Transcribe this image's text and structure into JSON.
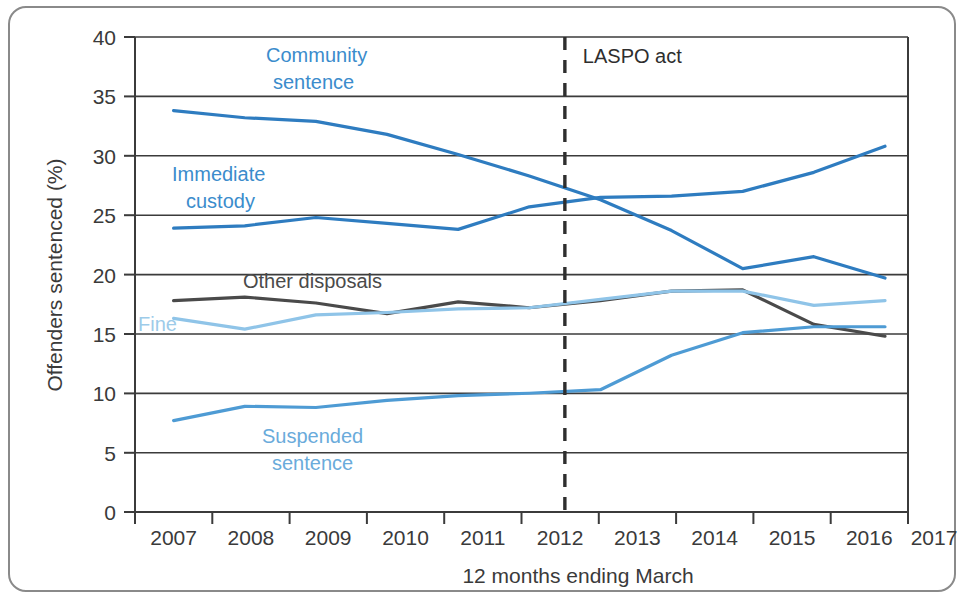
{
  "figure": {
    "border_color": "#8a8a8a",
    "background": "#ffffff"
  },
  "chart_data": {
    "type": "line",
    "title": "",
    "xlabel": "12 months ending March",
    "ylabel": "Offenders sentenced (%)",
    "categories": [
      "2007",
      "2008",
      "2009",
      "2010",
      "2011",
      "2012",
      "2013",
      "2014",
      "2015",
      "2016",
      "2017"
    ],
    "x": [
      2007,
      2008,
      2009,
      2010,
      2011,
      2012,
      2013,
      2014,
      2015,
      2016,
      2017
    ],
    "ylim": [
      0,
      40
    ],
    "yticks": [
      0,
      5,
      10,
      15,
      20,
      25,
      30,
      35,
      40
    ],
    "grid": "horizontal",
    "legend": "inline-annotations",
    "series": [
      {
        "name": "Community sentence",
        "color": "#2e7cc0",
        "values": [
          33.8,
          33.2,
          32.9,
          31.8,
          30.1,
          28.3,
          26.3,
          23.7,
          20.5,
          21.5,
          19.7
        ]
      },
      {
        "name": "Immediate custody",
        "color": "#2e7cc0",
        "values": [
          23.9,
          24.1,
          24.8,
          24.3,
          23.8,
          25.7,
          26.5,
          26.6,
          27.0,
          28.6,
          30.8
        ]
      },
      {
        "name": "Other disposals",
        "color": "#4a4a4a",
        "values": [
          17.8,
          18.1,
          17.6,
          16.7,
          17.7,
          17.2,
          17.8,
          18.6,
          18.7,
          15.8,
          14.8
        ]
      },
      {
        "name": "Fine",
        "color": "#8fc4e8",
        "values": [
          16.3,
          15.4,
          16.6,
          16.8,
          17.1,
          17.2,
          17.9,
          18.6,
          18.6,
          17.4,
          17.8
        ]
      },
      {
        "name": "Suspended sentence",
        "color": "#4e9bd4",
        "values": [
          7.7,
          8.9,
          8.8,
          9.4,
          9.8,
          10.0,
          10.3,
          13.2,
          15.1,
          15.6,
          15.6
        ]
      }
    ],
    "annotations": [
      {
        "text": "Community sentence",
        "color": "#3b8ccc",
        "kind": "series-label"
      },
      {
        "text": "Immediate custody",
        "color": "#3b8ccc",
        "kind": "series-label"
      },
      {
        "text": "Other disposals",
        "color": "#4a4a4a",
        "kind": "series-label"
      },
      {
        "text": "Fine",
        "color": "#9dcbe9",
        "kind": "series-label"
      },
      {
        "text": "Suspended sentence",
        "color": "#6aabdb",
        "kind": "series-label"
      },
      {
        "text": "LASPO act",
        "color": "#2e2e2e",
        "kind": "event-label",
        "x_value": 2012.5
      }
    ],
    "event_marker": {
      "label": "LASPO act",
      "x_value": 2012.5,
      "style": "dashed-vertical"
    }
  },
  "axis": {
    "y_tick_labels": [
      "0",
      "5",
      "10",
      "15",
      "20",
      "25",
      "30",
      "35",
      "40"
    ],
    "x_tick_labels": [
      "2007",
      "2008",
      "2009",
      "2010",
      "2011",
      "2012",
      "2013",
      "2014",
      "2015",
      "2016",
      "2017"
    ],
    "y_title": "Offenders sentenced (%)",
    "x_title": "12 months ending March"
  },
  "labels": {
    "community_line1": "Community",
    "community_line2": "sentence",
    "immediate_line1": "Immediate",
    "immediate_line2": "custody",
    "other_disposals": "Other disposals",
    "fine": "Fine",
    "suspended_line1": "Suspended",
    "suspended_line2": "sentence",
    "laspo": "LASPO act"
  }
}
